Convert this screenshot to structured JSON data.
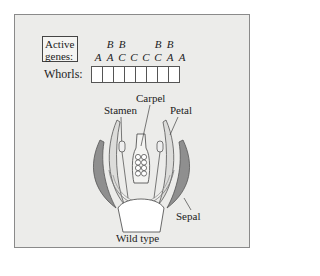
{
  "figure": {
    "active_genes_label": "Active genes:",
    "active_genes_line1": "Active",
    "active_genes_line2": "genes:",
    "whorls_label": "Whorls:",
    "genes_top": [
      "",
      "B",
      "B",
      "",
      "",
      "B",
      "B",
      ""
    ],
    "genes_bottom": [
      "A",
      "A",
      "C",
      "C",
      "C",
      "C",
      "A",
      "A"
    ],
    "whorl_count": 8,
    "labels": {
      "carpel": "Carpel",
      "stamen": "Stamen",
      "petal": "Petal",
      "sepal": "Sepal"
    },
    "caption": "Wild type",
    "colors": {
      "panel_bg": "#ececea",
      "sepal_fill": "#8f8f8f",
      "petal_fill": "#dcdcda",
      "outline": "#555555"
    }
  }
}
